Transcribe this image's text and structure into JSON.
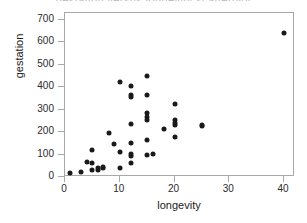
{
  "figure": {
    "title_remnant": "gestation versus longevity scatterplot",
    "background_color": "#ffffff",
    "frame_color": "#a8a8ac",
    "marker_color": "#1a1a1a",
    "text_color": "#1a1a1a"
  },
  "chart_data": {
    "type": "scatter",
    "title": "",
    "xlabel": "longevity",
    "ylabel": "gestation",
    "xlim": [
      0,
      42
    ],
    "ylim": [
      0,
      730
    ],
    "xticks": [
      0,
      10,
      20,
      30,
      40
    ],
    "yticks": [
      0,
      100,
      200,
      300,
      400,
      500,
      600,
      700
    ],
    "xtick_labels": [
      "0",
      "10",
      "20",
      "30",
      "40"
    ],
    "ytick_labels": [
      "0",
      "100",
      "200",
      "300",
      "400",
      "500",
      "600",
      "700"
    ],
    "grid": false,
    "legend": null,
    "marker": "filled-circle",
    "points": [
      {
        "x": 1,
        "y": 16
      },
      {
        "x": 3,
        "y": 21
      },
      {
        "x": 4,
        "y": 68
      },
      {
        "x": 5,
        "y": 63
      },
      {
        "x": 5,
        "y": 118
      },
      {
        "x": 5,
        "y": 31
      },
      {
        "x": 6,
        "y": 31
      },
      {
        "x": 6,
        "y": 42
      },
      {
        "x": 7,
        "y": 45
      },
      {
        "x": 7,
        "y": 42
      },
      {
        "x": 8,
        "y": 198
      },
      {
        "x": 9,
        "y": 148
      },
      {
        "x": 10,
        "y": 423
      },
      {
        "x": 10,
        "y": 110
      },
      {
        "x": 10,
        "y": 42
      },
      {
        "x": 12,
        "y": 406
      },
      {
        "x": 12,
        "y": 365
      },
      {
        "x": 12,
        "y": 355
      },
      {
        "x": 12,
        "y": 237
      },
      {
        "x": 12,
        "y": 151
      },
      {
        "x": 12,
        "y": 101
      },
      {
        "x": 12,
        "y": 94
      },
      {
        "x": 12,
        "y": 63
      },
      {
        "x": 15,
        "y": 448
      },
      {
        "x": 15,
        "y": 366
      },
      {
        "x": 15,
        "y": 284
      },
      {
        "x": 15,
        "y": 265
      },
      {
        "x": 15,
        "y": 252
      },
      {
        "x": 15,
        "y": 163
      },
      {
        "x": 15,
        "y": 100
      },
      {
        "x": 16,
        "y": 104
      },
      {
        "x": 18,
        "y": 213
      },
      {
        "x": 20,
        "y": 327
      },
      {
        "x": 20,
        "y": 252
      },
      {
        "x": 20,
        "y": 240
      },
      {
        "x": 20,
        "y": 230
      },
      {
        "x": 20,
        "y": 180
      },
      {
        "x": 25,
        "y": 230
      },
      {
        "x": 25,
        "y": 225
      },
      {
        "x": 40,
        "y": 640
      }
    ]
  }
}
